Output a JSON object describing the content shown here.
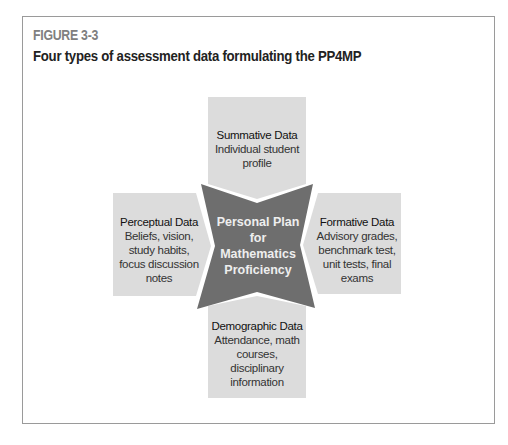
{
  "figure": {
    "label": "FIGURE 3-3",
    "title": "Four types of assessment data formulating the PP4MP"
  },
  "diagram": {
    "center": {
      "lines": [
        "Personal Plan",
        "for",
        "Mathematics",
        "Proficiency"
      ]
    },
    "top": {
      "heading": "Summative Data",
      "body": [
        "Individual student",
        "profile"
      ]
    },
    "left": {
      "heading": "Perceptual Data",
      "body": [
        "Beliefs, vision,",
        "study habits,",
        "focus discussion",
        "notes"
      ]
    },
    "right": {
      "heading": "Formative Data",
      "body": [
        "Advisory grades,",
        "benchmark test,",
        "unit tests, final",
        "exams"
      ]
    },
    "bottom": {
      "heading": "Demographic Data",
      "body": [
        "Attendance, math",
        "courses,",
        "disciplinary",
        "information"
      ]
    },
    "colors": {
      "box_fill": "#dcdcdc",
      "center_fill": "#6e6e6e",
      "center_text": "#eeeeee",
      "frame_border": "#9a9a9a",
      "label_color": "#808080"
    }
  }
}
